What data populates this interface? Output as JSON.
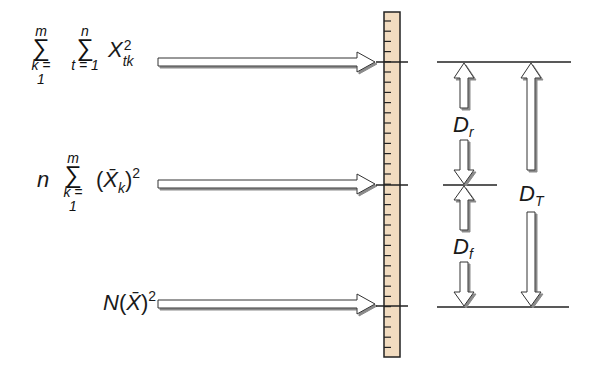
{
  "expressions": [
    {
      "id": "total",
      "sum1": {
        "upper": "m",
        "lower": "k = 1"
      },
      "sum2": {
        "upper": "n",
        "lower": "t = 1"
      },
      "term": "X",
      "term_sup": "2",
      "term_sub": "tk"
    },
    {
      "id": "between",
      "coef": "n",
      "sum1": {
        "upper": "m",
        "lower": "k = 1"
      },
      "term_open": "(",
      "term": "X̄",
      "term_sub": "k",
      "term_close": ")",
      "term_sup": "2"
    },
    {
      "id": "correction",
      "coef": "N",
      "term_open": "(",
      "term": "X̄",
      "term_close": ")",
      "term_sup": "2"
    }
  ],
  "labels": {
    "dr": {
      "main": "D",
      "sub": "r"
    },
    "df": {
      "main": "D",
      "sub": "f"
    },
    "dt": {
      "main": "D",
      "sub": "T"
    }
  },
  "colors": {
    "ruler_fill": "#f2dcc0",
    "ruler_stroke": "#222222",
    "arrow_fill": "#ffffff",
    "arrow_shadow": "#8a8a8a",
    "line": "#222222"
  }
}
